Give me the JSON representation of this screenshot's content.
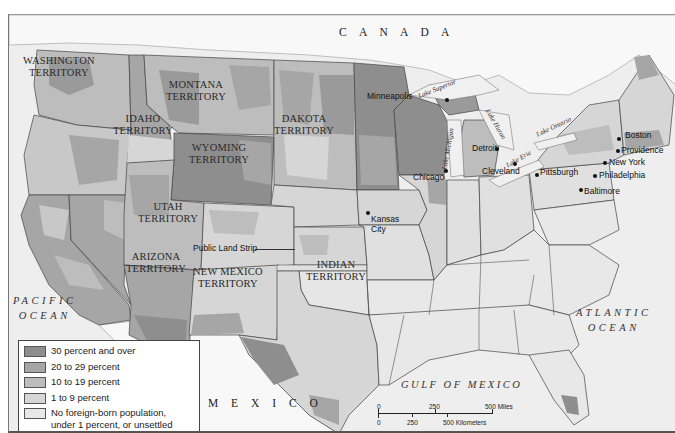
{
  "map": {
    "countries": [
      {
        "id": "canada",
        "label": "C A N A D A"
      },
      {
        "id": "mexico",
        "label": "M E X I C O"
      }
    ],
    "water_bodies": {
      "pacific": {
        "line1": "PACIFIC",
        "line2": "OCEAN"
      },
      "atlantic": {
        "line1": "ATLANTIC",
        "line2": "OCEAN"
      },
      "gulf": "GULF OF MEXICO",
      "lakes": {
        "superior": "Lake Superior",
        "michigan": "Lake Michigan",
        "huron": "Lake Huron",
        "erie": "Lake Erie",
        "ontario": "Lake Ontario"
      }
    },
    "territories": {
      "washington": {
        "line1": "WASHINGTON",
        "line2": "TERRITORY"
      },
      "montana": {
        "line1": "MONTANA",
        "line2": "TERRITORY"
      },
      "idaho": {
        "line1": "IDAHO",
        "line2": "TERRITORY"
      },
      "dakota": {
        "line1": "DAKOTA",
        "line2": "TERRITORY"
      },
      "wyoming": {
        "line1": "WYOMING",
        "line2": "TERRITORY"
      },
      "utah": {
        "line1": "UTAH",
        "line2": "TERRITORY"
      },
      "arizona": {
        "line1": "ARIZONA",
        "line2": "TERRITORY"
      },
      "new_mexico": {
        "line1": "NEW MEXICO",
        "line2": "TERRITORY"
      },
      "indian": {
        "line1": "INDIAN",
        "line2": "TERRITORY"
      }
    },
    "public_land_strip": "Public Land Strip",
    "cities": {
      "minneapolis": "Minneapolis",
      "chicago": "Chicago",
      "detroit": "Detroit",
      "cleveland": "Cleveland",
      "pittsburgh": "Pittsburgh",
      "boston": "Boston",
      "providence": "Providence",
      "new_york": "New York",
      "philadelphia": "Philadelphia",
      "baltimore": "Baltimore",
      "kansas_city_1": "Kansas",
      "kansas_city_2": "City"
    }
  },
  "legend": {
    "items": [
      {
        "label": "30 percent and over",
        "color": "#8e8e8e"
      },
      {
        "label": "20 to 29 percent",
        "color": "#a6a6a6"
      },
      {
        "label": "10 to 19 percent",
        "color": "#bdbdbd"
      },
      {
        "label": "1 to 9 percent",
        "color": "#d6d6d6"
      },
      {
        "label_line1": "No foreign-born population,",
        "label_line2": "under 1 percent, or unsettled",
        "color": "#e8e8e8"
      }
    ]
  },
  "scale_bar": {
    "miles": {
      "zero": "0",
      "mid": "250",
      "end": "500 Miles"
    },
    "km": {
      "zero": "0",
      "mid": "250",
      "end": "500 Kilometers"
    }
  },
  "colors": {
    "tier_30_plus": "#8e8e8e",
    "tier_20_29": "#a6a6a6",
    "tier_10_19": "#bdbdbd",
    "tier_1_9": "#d6d6d6",
    "tier_none": "#e8e8e8",
    "water": "#f0f0f0",
    "foreign_land": "#f7f7f7"
  }
}
